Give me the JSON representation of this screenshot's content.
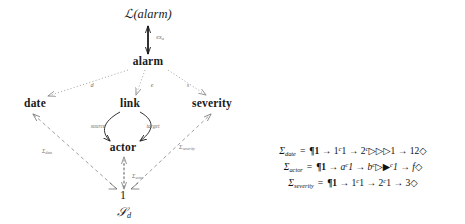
{
  "figure": {
    "type": "commutative-diagram",
    "nodes": [
      {
        "id": "l-alarm",
        "label": "ℒ(alarm)",
        "x": 148,
        "y": 14,
        "style": "calligraphic"
      },
      {
        "id": "alarm",
        "label": "alarm",
        "x": 148,
        "y": 62,
        "style": "bold"
      },
      {
        "id": "date",
        "label": "date",
        "x": 35,
        "y": 104,
        "style": "bold"
      },
      {
        "id": "link",
        "label": "link",
        "x": 130,
        "y": 104,
        "style": "bold"
      },
      {
        "id": "severity",
        "label": "severity",
        "x": 212,
        "y": 104,
        "style": "bold"
      },
      {
        "id": "actor",
        "label": "actor",
        "x": 123,
        "y": 148,
        "style": "bold"
      },
      {
        "id": "one",
        "label": "1",
        "x": 123,
        "y": 195,
        "style": "plain"
      },
      {
        "id": "s-d",
        "label": "𝒮",
        "sub": "d",
        "x": 124,
        "y": 213,
        "style": "calligraphic"
      }
    ],
    "edge_labels": [
      {
        "id": "ex-a",
        "text": "ex",
        "sub": "a",
        "x": 160,
        "y": 38
      },
      {
        "id": "d",
        "text": "d",
        "sub": "",
        "x": 92,
        "y": 85
      },
      {
        "id": "e",
        "text": "e",
        "sub": "",
        "x": 152,
        "y": 85
      },
      {
        "id": "s",
        "text": "s",
        "sub": "",
        "x": 188,
        "y": 85
      },
      {
        "id": "source",
        "text": "source",
        "sub": "",
        "x": 98,
        "y": 127
      },
      {
        "id": "target",
        "text": "target",
        "sub": "",
        "x": 153,
        "y": 127
      },
      {
        "id": "sigma-date",
        "text": "Σ",
        "sub": "date",
        "x": 47,
        "y": 152
      },
      {
        "id": "sigma-actor",
        "text": "Σ",
        "sub": "actor",
        "x": 138,
        "y": 177
      },
      {
        "id": "sigma-sever",
        "text": "Σ",
        "sub": "severity",
        "x": 187,
        "y": 148
      }
    ]
  },
  "equations": [
    {
      "id": "sigma-date-eq",
      "lhs": "Σ",
      "lhs_sub": "date",
      "eq": "=",
      "rhs_parts": [
        {
          "t": "¶1",
          "k": "pilcrow-bold"
        },
        {
          "t": " → 1",
          "k": "plain"
        },
        {
          "t": "c",
          "k": "sup"
        },
        {
          "t": "1 → 2",
          "k": "plain"
        },
        {
          "t": "c",
          "k": "sup"
        },
        {
          "t": "▷▷▷1",
          "k": "plain"
        },
        {
          "t": " → 12◇",
          "k": "plain"
        }
      ],
      "rhs_text": "¶1 → 1c1 → 2c▷▷▷1 → 12◇"
    },
    {
      "id": "sigma-actor-eq",
      "lhs": "Σ",
      "lhs_sub": "actor",
      "eq": "=",
      "rhs_parts": [
        {
          "t": "¶1",
          "k": "pilcrow-bold"
        },
        {
          "t": " → a",
          "k": "italic"
        },
        {
          "t": "c",
          "k": "sup"
        },
        {
          "t": "1 → b",
          "k": "italic"
        },
        {
          "t": "c",
          "k": "sup"
        },
        {
          "t": "▷▶",
          "k": "plain"
        },
        {
          "t": "c",
          "k": "sup"
        },
        {
          "t": "1 → f◇",
          "k": "italic"
        }
      ],
      "rhs_text": "¶1 → ac1 → bc▷▶c1 → f◇"
    },
    {
      "id": "sigma-severity-eq",
      "lhs": "Σ",
      "lhs_sub": "severity",
      "eq": "=",
      "rhs_parts": [
        {
          "t": "¶1",
          "k": "pilcrow-bold"
        },
        {
          "t": " → 1",
          "k": "plain"
        },
        {
          "t": "c",
          "k": "sup"
        },
        {
          "t": "1 → 2",
          "k": "plain"
        },
        {
          "t": "c",
          "k": "sup"
        },
        {
          "t": "1 → 3◇",
          "k": "plain"
        }
      ],
      "rhs_text": "¶1 → 1c1 → 2c1 → 3◇"
    }
  ],
  "colors": {
    "text": "#1a1a1a",
    "edge_label": "#6f6f6f",
    "solid_arrow": "#1a1a1a",
    "dotted_arrow": "#8a8a8a",
    "dashed_arrow": "#7a7a7a"
  }
}
